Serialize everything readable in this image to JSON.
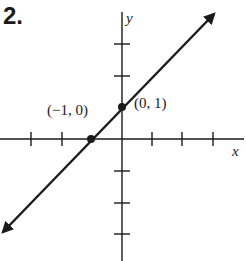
{
  "problem_number": "2.",
  "axes": {
    "x_label": "x",
    "y_label": "y"
  },
  "points": [
    {
      "label": "(−1, 0)",
      "x": -1,
      "y": 0
    },
    {
      "label": "(0, 1)",
      "x": 0,
      "y": 1
    }
  ],
  "line": {
    "equation": "y = x + 1",
    "color": "#1a1a1a"
  }
}
